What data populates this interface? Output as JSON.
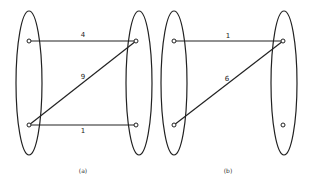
{
  "figures": [
    {
      "id": "a",
      "caption": "(a)",
      "left_set": {
        "nodes": [
          {
            "id": "L1",
            "x": 29,
            "y": 41
          },
          {
            "id": "L2",
            "x": 29,
            "y": 125
          }
        ]
      },
      "right_set": {
        "nodes": [
          {
            "id": "R1",
            "x": 136,
            "y": 41
          },
          {
            "id": "R2",
            "x": 136,
            "y": 125
          }
        ]
      },
      "edges": [
        {
          "from": "L1",
          "to": "R1",
          "weight": "4",
          "label_x": 83,
          "label_y": 37
        },
        {
          "from": "L2",
          "to": "R1",
          "weight": "9",
          "label_x": 83,
          "label_y": 79
        },
        {
          "from": "L2",
          "to": "R2",
          "weight": "1",
          "label_x": 83,
          "label_y": 133
        }
      ]
    },
    {
      "id": "b",
      "caption": "(b)",
      "left_set": {
        "nodes": [
          {
            "id": "L1",
            "x": 174,
            "y": 41
          },
          {
            "id": "L2",
            "x": 174,
            "y": 125
          }
        ]
      },
      "right_set": {
        "nodes": [
          {
            "id": "R1",
            "x": 283,
            "y": 41
          },
          {
            "id": "R2",
            "x": 283,
            "y": 125
          }
        ]
      },
      "edges": [
        {
          "from": "L1",
          "to": "R1",
          "weight": "1",
          "label_x": 228,
          "label_y": 38
        },
        {
          "from": "L2",
          "to": "R1",
          "weight": "6",
          "label_x": 227,
          "label_y": 81
        }
      ]
    }
  ]
}
